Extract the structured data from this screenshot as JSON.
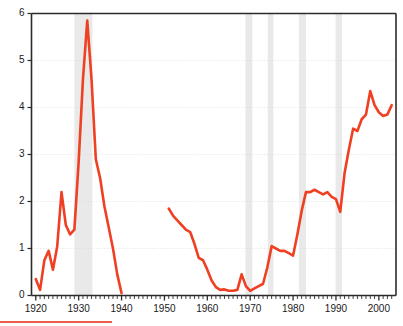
{
  "chart": {
    "title": "",
    "subtitle": "",
    "accent_color": "#ef4023",
    "band_color": "#e9e9e9",
    "grid_color": "#dcdcdc",
    "axis_color": "#2b2b2b",
    "background": "#ffffff"
  },
  "chart_data": {
    "type": "line",
    "title": "",
    "xlabel": "",
    "ylabel": "",
    "xlim": [
      1919,
      2004
    ],
    "ylim": [
      0,
      6
    ],
    "yticks": [
      0,
      1,
      2,
      3,
      4,
      5,
      6
    ],
    "ytick_labels": [
      "0",
      "1",
      "2",
      "3",
      "4",
      "5",
      "6"
    ],
    "xticks": [
      1920,
      1930,
      1940,
      1950,
      1960,
      1970,
      1980,
      1990,
      2000
    ],
    "xtick_labels": [
      "1920",
      "1930",
      "1940",
      "1950",
      "1960",
      "1970",
      "1980",
      "1990",
      "2000"
    ],
    "minor_xtick_step": 1,
    "grid": "horizontal-dotted",
    "legend": "none",
    "series": [
      {
        "name": "series-1",
        "color": "#ef4023",
        "x": [
          1920,
          1921,
          1922,
          1923,
          1924,
          1925,
          1926,
          1927,
          1928,
          1929,
          1930,
          1931,
          1932,
          1933,
          1934,
          1935,
          1936,
          1937,
          1938,
          1939,
          1940
        ],
        "values": [
          0.35,
          0.12,
          0.75,
          0.95,
          0.55,
          1.05,
          2.2,
          1.5,
          1.3,
          1.4,
          2.85,
          4.6,
          5.85,
          4.6,
          2.9,
          2.5,
          1.9,
          1.45,
          1.0,
          0.45,
          0.05
        ]
      },
      {
        "name": "series-2",
        "color": "#ef4023",
        "x": [
          1951,
          1952,
          1953,
          1954,
          1955,
          1956,
          1957,
          1958,
          1959,
          1960,
          1961,
          1962,
          1963,
          1964,
          1965,
          1966,
          1967,
          1968,
          1969,
          1970,
          1971,
          1972,
          1973,
          1974,
          1975,
          1976,
          1977,
          1978,
          1979,
          1980,
          1981,
          1982,
          1983,
          1984,
          1985,
          1986,
          1987,
          1988,
          1989,
          1990,
          1991,
          1992,
          1993,
          1994,
          1995,
          1996,
          1997,
          1998,
          1999,
          2000,
          2001,
          2002,
          2003
        ],
        "values": [
          1.85,
          1.7,
          1.6,
          1.5,
          1.4,
          1.35,
          1.1,
          0.8,
          0.75,
          0.55,
          0.32,
          0.18,
          0.12,
          0.13,
          0.1,
          0.1,
          0.12,
          0.45,
          0.2,
          0.1,
          0.15,
          0.2,
          0.25,
          0.6,
          1.05,
          1.0,
          0.95,
          0.95,
          0.9,
          0.85,
          1.3,
          1.8,
          2.2,
          2.2,
          2.25,
          2.2,
          2.15,
          2.2,
          2.1,
          2.05,
          1.78,
          2.6,
          3.1,
          3.55,
          3.5,
          3.75,
          3.85,
          4.35,
          4.05,
          3.9,
          3.82,
          3.85,
          4.05
        ]
      }
    ],
    "shaded_bands": [
      {
        "name": "band-1929-1933",
        "x0": 1929.0,
        "x1": 1933.2
      },
      {
        "name": "band-1969-1970",
        "x0": 1968.9,
        "x1": 1970.5
      },
      {
        "name": "band-1974-1975",
        "x0": 1974.1,
        "x1": 1975.4
      },
      {
        "name": "band-1981-1983",
        "x0": 1981.4,
        "x1": 1983.0
      },
      {
        "name": "band-1990-1991",
        "x0": 1989.9,
        "x1": 1991.4
      }
    ]
  }
}
